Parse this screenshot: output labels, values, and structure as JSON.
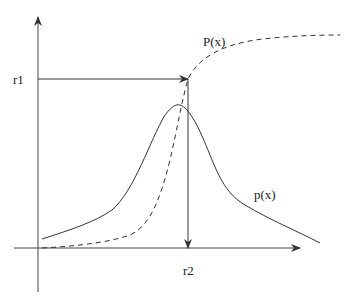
{
  "figure": {
    "title": "",
    "colors": {
      "axes": "#333333",
      "curves": "#333333",
      "background": "#ffffff"
    }
  },
  "labels": {
    "r1": "r1",
    "r2": "r2",
    "cdf": "P(x)",
    "pdf": "p(x)"
  },
  "curves": [
    {
      "id": "pdf",
      "name": "p(x)",
      "style": "solid",
      "shape": "bell-shaped peak"
    },
    {
      "id": "cdf",
      "name": "P(x)",
      "style": "dashed",
      "shape": "sigmoid rising to plateau"
    }
  ],
  "arrows": [
    {
      "id": "r1-to-cdf",
      "from": "r1 on y-axis",
      "to": "P(x) curve",
      "direction": "right"
    },
    {
      "id": "cdf-to-r2",
      "from": "P(x) curve",
      "to": "r2 on x-axis",
      "direction": "down"
    }
  ]
}
